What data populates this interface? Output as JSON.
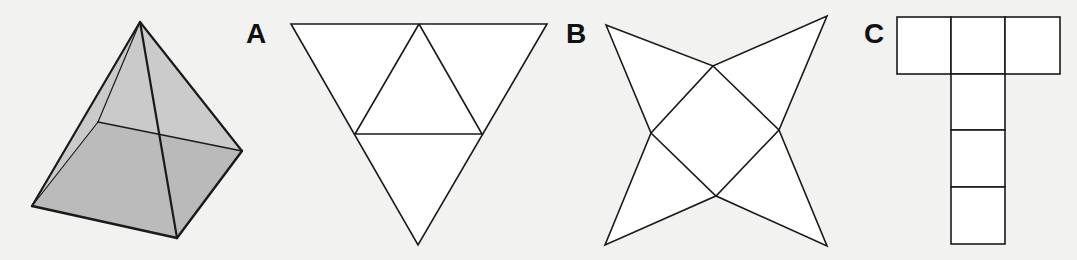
{
  "figure": {
    "colors": {
      "background": "#f2f2f1",
      "stroke": "#1a1a1a",
      "net_fill": "#ffffff",
      "pyramid_side_fill": "#d0d0d0",
      "pyramid_base_fill": "#b3b3b3"
    }
  },
  "pyramid": {
    "apex": [
      140,
      22
    ],
    "base": {
      "left": [
        32,
        206
      ],
      "front": [
        177,
        238
      ],
      "right": [
        242,
        151
      ],
      "back": [
        98,
        122
      ]
    }
  },
  "options": [
    {
      "id": "A",
      "label": "A",
      "label_pos": [
        246,
        20
      ],
      "shape": "triangle net of four triangles"
    },
    {
      "id": "B",
      "label": "B",
      "label_pos": [
        566,
        20
      ],
      "shape": "square with four triangles (star net)"
    },
    {
      "id": "C",
      "label": "C",
      "label_pos": [
        864,
        20
      ],
      "shape": "six-square T net"
    }
  ]
}
